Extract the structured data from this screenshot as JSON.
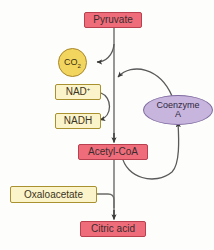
{
  "diagram": {
    "background_color": "#fdfdfb",
    "colors": {
      "pink_fill": "#ef6d7a",
      "pink_border": "#b9414f",
      "yellow_fill": "#fbf3c9",
      "yellow_border": "#a9912f",
      "gold_fill": "#f2d55e",
      "gold_border": "#a9862a",
      "purple_fill": "#c7b5dd",
      "purple_border": "#7f6ba0",
      "arrow_color": "#585858"
    },
    "nodes": {
      "pyruvate": {
        "label": "Pyruvate",
        "shape": "rect",
        "color": "pink"
      },
      "co2": {
        "label": "CO",
        "subscript": "2",
        "shape": "circle",
        "color": "gold"
      },
      "nad_plus": {
        "label": "NAD",
        "superscript": "+",
        "shape": "rect",
        "color": "yellow"
      },
      "nadh": {
        "label": "NADH",
        "shape": "rect",
        "color": "yellow"
      },
      "coenzyme_a": {
        "label_line1": "Coenzyme",
        "label_line2": "A",
        "shape": "ellipse",
        "color": "purple"
      },
      "acetyl_coa": {
        "label": "Acetyl-CoA",
        "shape": "rect",
        "color": "pink"
      },
      "oxaloacetate": {
        "label": "Oxaloacetate",
        "shape": "rect",
        "color": "yellow"
      },
      "citric_acid": {
        "label": "Citric acid",
        "shape": "rect",
        "color": "pink"
      }
    },
    "edges": [
      {
        "name": "pyruvate-to-acetylcoa",
        "from": "pyruvate",
        "to": "acetyl_coa",
        "style": "straight-arrow"
      },
      {
        "name": "pyruvate-to-co2",
        "from": "main-stem",
        "to": "co2",
        "style": "curved-arrow"
      },
      {
        "name": "nadplus-to-nadh",
        "from": "nad_plus",
        "to": "nadh",
        "style": "curved-arrow"
      },
      {
        "name": "coenzymea-to-stem",
        "from": "coenzyme_a",
        "to": "main-stem",
        "style": "curved-arrow"
      },
      {
        "name": "acetylcoa-to-coenzymea",
        "from": "acetyl_coa",
        "to": "coenzyme_a",
        "style": "curved-arrow"
      },
      {
        "name": "acetylcoa-to-citricacid",
        "from": "acetyl_coa",
        "to": "citric_acid",
        "style": "straight-arrow"
      },
      {
        "name": "oxaloacetate-to-citricacid",
        "from": "oxaloacetate",
        "to": "citric_acid",
        "style": "elbow-line"
      }
    ]
  }
}
